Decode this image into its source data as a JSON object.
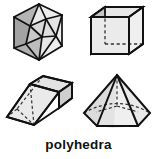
{
  "figure": {
    "caption": "polyhedra",
    "background_color": "#ffffff",
    "stroke_color": "#111111",
    "fill_light": "#ebebeb",
    "fill_mid": "#d2d2d2",
    "fill_dark": "#a9a9a9",
    "fill_darker": "#9a9a9a",
    "hidden_edge_style": "dashed"
  },
  "shapes": [
    {
      "name": "icosahedron",
      "label": "icosahedron",
      "position": "top-left",
      "faces_visible": "triangular facets",
      "silhouette": "hexagon",
      "hidden_edges": false
    },
    {
      "name": "cube",
      "label": "cube",
      "position": "top-right",
      "faces_visible": "front square, top, left",
      "silhouette": "hexagon",
      "hidden_edges": true
    },
    {
      "name": "rectangular-prism",
      "label": "rectangular prism",
      "position": "bottom-left",
      "faces_visible": "long front, top, end",
      "silhouette": "oblique box",
      "hidden_edges": true
    },
    {
      "name": "hexagonal-pyramid",
      "label": "hexagonal pyramid",
      "position": "bottom-right",
      "faces_visible": "front triangular faces",
      "silhouette": "triangle on hexagonal base",
      "hidden_edges": true
    }
  ]
}
